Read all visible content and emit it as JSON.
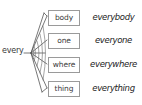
{
  "diagram": {
    "type": "word-building-web",
    "root_word": "every",
    "background_color": "#ffffff",
    "line_color": "#555555",
    "box_border_color": "#9a9a9a",
    "text_color": "#3a3a3a",
    "result_text_color": "#1c1c1c",
    "hub": {
      "x": 31,
      "y": 53
    },
    "entries": [
      {
        "suffix": "body",
        "compound": "everybody"
      },
      {
        "suffix": "one",
        "compound": "everyone"
      },
      {
        "suffix": "where",
        "compound": "everywhere"
      },
      {
        "suffix": "thing",
        "compound": "everything"
      }
    ]
  }
}
